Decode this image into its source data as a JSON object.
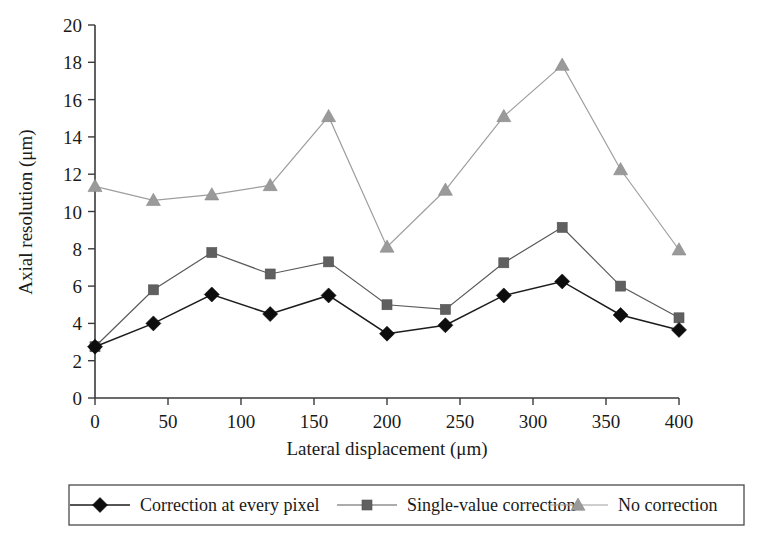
{
  "chart_data": {
    "type": "line",
    "title": "",
    "xlabel": "Lateral displacement (μm)",
    "ylabel": "Axial resolution (μm)",
    "xlim": [
      0,
      400
    ],
    "ylim": [
      0,
      20
    ],
    "xticks": [
      0,
      50,
      100,
      150,
      200,
      250,
      300,
      350,
      400
    ],
    "yticks": [
      0,
      2,
      4,
      6,
      8,
      10,
      12,
      14,
      16,
      18,
      20
    ],
    "xtick_labels": [
      "0",
      "50",
      "100",
      "150",
      "200",
      "250",
      "300",
      "350",
      "400"
    ],
    "ytick_labels": [
      "0",
      "2",
      "4",
      "6",
      "8",
      "10",
      "12",
      "14",
      "16",
      "18",
      "20"
    ],
    "grid": false,
    "legend_position": "bottom-outside",
    "x": [
      0,
      40,
      80,
      120,
      160,
      200,
      240,
      280,
      320,
      360,
      400
    ],
    "series": [
      {
        "name": "Correction at every pixel",
        "marker": "diamond",
        "color": "#0d0d0d",
        "line_color": "#1c1c1c",
        "values": [
          2.75,
          4.0,
          5.55,
          4.5,
          5.5,
          3.45,
          3.9,
          5.5,
          6.25,
          4.45,
          3.65
        ]
      },
      {
        "name": "Single-value correction",
        "marker": "square",
        "color": "#606060",
        "line_color": "#5a5a5a",
        "values": [
          2.75,
          5.8,
          7.8,
          6.65,
          7.3,
          5.0,
          4.75,
          7.25,
          9.15,
          6.0,
          4.3
        ]
      },
      {
        "name": "No correction",
        "marker": "triangle",
        "color": "#9a9a9a",
        "line_color": "#9e9e9e",
        "values": [
          11.35,
          10.6,
          10.9,
          11.4,
          15.1,
          8.1,
          11.15,
          15.1,
          17.85,
          12.25,
          7.95
        ]
      }
    ]
  },
  "legend": {
    "items": [
      {
        "label": "Correction at every pixel",
        "marker": "diamond-marker-icon"
      },
      {
        "label": "Single-value correction",
        "marker": "square-marker-icon"
      },
      {
        "label": "No correction",
        "marker": "triangle-marker-icon"
      }
    ]
  },
  "axes": {
    "x_title": "Lateral displacement (μm)",
    "y_title": "Axial resolution (μm)"
  }
}
